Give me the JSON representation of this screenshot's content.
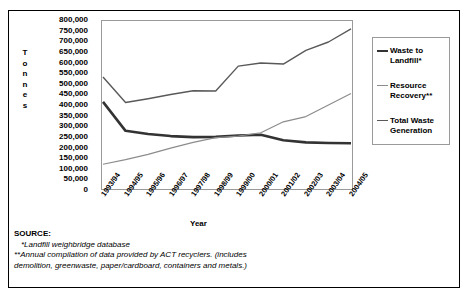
{
  "chart_data": {
    "type": "line",
    "title": "",
    "xlabel": "Year",
    "ylabel": "Tonnes",
    "ylim": [
      0,
      800000
    ],
    "ytick_step": 50000,
    "grid": false,
    "legend_position": "right",
    "categories": [
      "1993/94",
      "1994/95",
      "1995/96",
      "1996/97",
      "1997/98",
      "1998/99",
      "1999/00",
      "2000/01",
      "2001/02",
      "2002/03",
      "2003/04",
      "2004/05"
    ],
    "yticks": [
      "800,000",
      "750,000",
      "700,000",
      "650,000",
      "600,000",
      "550,000",
      "500,000",
      "450,000",
      "400,000",
      "350,000",
      "300,000",
      "250,000",
      "200,000",
      "150,000",
      "100,000",
      "50,000",
      "0"
    ],
    "series": [
      {
        "name": "Waste to Landfill*",
        "color": "#333333",
        "width": 2.6,
        "values": [
          415000,
          277000,
          262000,
          252000,
          247000,
          248000,
          255000,
          258000,
          232000,
          222000,
          219000,
          218000
        ]
      },
      {
        "name": "Resource Recovery**",
        "color": "#8c8c8c",
        "width": 1.2,
        "values": [
          118000,
          140000,
          165000,
          195000,
          222000,
          245000,
          252000,
          268000,
          320000,
          345000,
          400000,
          455000
        ]
      },
      {
        "name": "Total Waste Generation",
        "color": "#595959",
        "width": 1.4,
        "values": [
          533000,
          412000,
          430000,
          450000,
          468000,
          467000,
          585000,
          600000,
          595000,
          660000,
          700000,
          762000
        ]
      }
    ]
  },
  "axis": {
    "ylabel_letters": [
      "T",
      "o",
      "n",
      "n",
      "e",
      "s"
    ],
    "xlabel": "Year"
  },
  "legend": {
    "items": [
      {
        "label_line1": "Waste to",
        "label_line2": "Landfill*"
      },
      {
        "label_line1": "Resource",
        "label_line2": "Recovery**"
      },
      {
        "label_line1": "Total Waste",
        "label_line2": "Generation"
      }
    ]
  },
  "source": {
    "heading": "SOURCE:",
    "note1": "*Landfill weighbridge database",
    "note2": "**Annual compilation of data provided by ACT recyclers. (includes",
    "note3": "demolition, greenwaste, paper/cardboard, containers and metals.)"
  }
}
